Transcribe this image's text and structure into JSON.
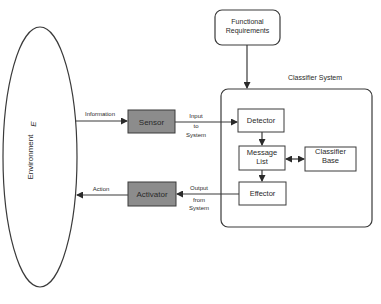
{
  "diagram": {
    "environment": {
      "label": "Environment",
      "symbol": "E"
    },
    "functional_requirements": {
      "line1": "Functional",
      "line2": "Requirements"
    },
    "classifier_system": {
      "title": "Classifier System"
    },
    "sensor": {
      "label": "Sensor"
    },
    "activator": {
      "label": "Activator"
    },
    "detector": {
      "label": "Detector"
    },
    "message_list": {
      "line1": "Message",
      "line2": "List"
    },
    "classifier_base": {
      "line1": "Classifier",
      "line2": "Base"
    },
    "effector": {
      "label": "Effector"
    },
    "edges": {
      "information": "Information",
      "input_l1": "Input",
      "input_l2": "to",
      "input_l3": "System",
      "output_l1": "Output",
      "output_l2": "from",
      "output_l3": "System",
      "action": "Action"
    },
    "colors": {
      "line": "#3a3a3a",
      "gray_box": "#8c8c8c"
    }
  }
}
